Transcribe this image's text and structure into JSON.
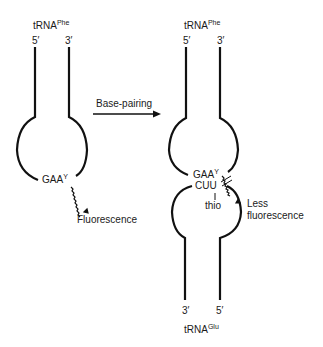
{
  "left_trna": {
    "name": "tRNA",
    "superscript": "Phe",
    "end5": "5′",
    "end3": "3′",
    "anticodon": "GAA",
    "modified_base": "Y",
    "emission_label": "Fluorescence"
  },
  "arrow": {
    "label": "Base-pairing"
  },
  "right_complex": {
    "top_trna": {
      "name": "tRNA",
      "superscript": "Phe",
      "end5": "5′",
      "end3": "3′",
      "anticodon": "GAA",
      "modified_base": "Y"
    },
    "bottom_trna": {
      "name": "tRNA",
      "superscript": "Glu",
      "end3": "3′",
      "end5": "5′",
      "anticodon": "CUU",
      "modification": "thio"
    },
    "emission_label_line1": "Less",
    "emission_label_line2": "fluorescence"
  },
  "colors": {
    "stroke": "#111111",
    "text": "#1a1a1a",
    "background": "#ffffff"
  }
}
